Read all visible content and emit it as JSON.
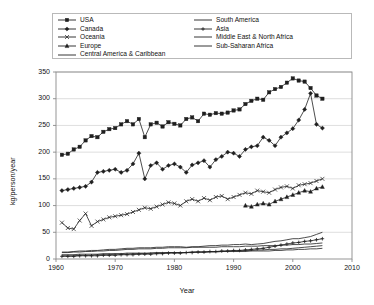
{
  "chart_data": {
    "type": "line",
    "title": "",
    "xlabel": "Year",
    "ylabel": "kg/person/year",
    "xlim": [
      1960,
      2010
    ],
    "ylim": [
      0,
      350
    ],
    "xticks": [
      1960,
      1970,
      1980,
      1990,
      2000,
      2010
    ],
    "yticks": [
      0,
      50,
      100,
      150,
      200,
      250,
      300,
      350
    ],
    "grid": "horizontal",
    "legend_position": "top",
    "legend_columns": 2,
    "x": [
      1961,
      1962,
      1963,
      1964,
      1965,
      1966,
      1967,
      1968,
      1969,
      1970,
      1971,
      1972,
      1973,
      1974,
      1975,
      1976,
      1977,
      1978,
      1979,
      1980,
      1981,
      1982,
      1983,
      1984,
      1985,
      1986,
      1987,
      1988,
      1989,
      1990,
      1991,
      1992,
      1993,
      1994,
      1995,
      1996,
      1997,
      1998,
      1999,
      2000,
      2001,
      2002,
      2003,
      2004,
      2005
    ],
    "series": [
      {
        "name": "USA",
        "marker": "square",
        "values": [
          195,
          197,
          205,
          210,
          222,
          230,
          228,
          238,
          243,
          245,
          252,
          258,
          252,
          262,
          228,
          252,
          255,
          248,
          256,
          253,
          250,
          262,
          265,
          258,
          272,
          270,
          273,
          272,
          274,
          278,
          280,
          290,
          296,
          300,
          298,
          312,
          318,
          322,
          330,
          338,
          334,
          332,
          320,
          306,
          300
        ]
      },
      {
        "name": "Canada",
        "marker": "diamond",
        "values": [
          128,
          130,
          132,
          134,
          136,
          144,
          162,
          164,
          166,
          168,
          162,
          166,
          178,
          198,
          150,
          175,
          180,
          168,
          175,
          178,
          172,
          162,
          176,
          180,
          184,
          172,
          186,
          192,
          200,
          198,
          192,
          205,
          210,
          212,
          228,
          222,
          212,
          228,
          236,
          244,
          260,
          280,
          310,
          252,
          245
        ]
      },
      {
        "name": "Oceania",
        "marker": "x",
        "values": [
          68,
          58,
          56,
          72,
          85,
          62,
          70,
          74,
          78,
          80,
          82,
          84,
          88,
          92,
          96,
          94,
          98,
          102,
          106,
          104,
          100,
          108,
          112,
          108,
          114,
          110,
          116,
          118,
          112,
          116,
          120,
          124,
          122,
          128,
          126,
          124,
          130,
          134,
          136,
          132,
          138,
          140,
          142,
          146,
          150
        ]
      },
      {
        "name": "Europe",
        "marker": "triangle",
        "values": [
          null,
          null,
          null,
          null,
          null,
          null,
          null,
          null,
          null,
          null,
          null,
          null,
          null,
          null,
          null,
          null,
          null,
          null,
          null,
          null,
          null,
          null,
          null,
          null,
          null,
          null,
          null,
          null,
          null,
          null,
          null,
          100,
          98,
          102,
          104,
          102,
          108,
          112,
          116,
          120,
          124,
          128,
          126,
          132,
          135
        ]
      },
      {
        "name": "Central America & Caribbean",
        "marker": "none",
        "values": [
          12,
          12,
          13,
          13,
          14,
          14,
          15,
          15,
          16,
          16,
          17,
          18,
          18,
          19,
          19,
          19,
          20,
          20,
          21,
          21,
          21,
          21,
          22,
          22,
          22,
          22,
          22,
          23,
          23,
          23,
          23,
          24,
          24,
          24,
          25,
          25,
          25,
          26,
          26,
          27,
          27,
          28,
          28,
          29,
          30
        ]
      },
      {
        "name": "South America",
        "marker": "none",
        "values": [
          13,
          13,
          14,
          15,
          15,
          16,
          16,
          17,
          18,
          18,
          19,
          20,
          20,
          21,
          21,
          21,
          22,
          22,
          23,
          23,
          23,
          22,
          23,
          23,
          24,
          25,
          25,
          26,
          26,
          27,
          27,
          28,
          27,
          28,
          29,
          31,
          33,
          34,
          36,
          38,
          38,
          40,
          42,
          46,
          50
        ]
      },
      {
        "name": "Asia",
        "marker": "plus",
        "values": [
          5,
          5,
          5,
          6,
          6,
          6,
          6,
          7,
          7,
          7,
          8,
          8,
          8,
          9,
          9,
          9,
          10,
          10,
          11,
          11,
          11,
          12,
          12,
          13,
          13,
          14,
          14,
          15,
          15,
          16,
          16,
          17,
          18,
          19,
          20,
          22,
          24,
          26,
          28,
          30,
          31,
          33,
          34,
          36,
          38
        ]
      },
      {
        "name": "Middle East & North Africa",
        "marker": "none",
        "values": [
          6,
          6,
          6,
          7,
          7,
          7,
          8,
          8,
          8,
          9,
          9,
          9,
          10,
          10,
          10,
          11,
          11,
          11,
          12,
          12,
          12,
          12,
          13,
          13,
          13,
          14,
          14,
          14,
          15,
          15,
          15,
          16,
          16,
          17,
          17,
          18,
          18,
          19,
          19,
          20,
          21,
          22,
          23,
          24,
          25
        ]
      },
      {
        "name": "Sub-Saharan Africa",
        "marker": "none",
        "values": [
          8,
          8,
          8,
          9,
          9,
          9,
          9,
          10,
          10,
          10,
          10,
          11,
          11,
          11,
          11,
          11,
          12,
          12,
          12,
          12,
          12,
          12,
          13,
          13,
          13,
          13,
          13,
          14,
          14,
          14,
          14,
          14,
          15,
          15,
          15,
          15,
          16,
          16,
          17,
          17,
          18,
          18,
          19,
          19,
          20
        ]
      }
    ]
  },
  "legend": {
    "left_column": [
      {
        "label": "USA",
        "marker": "square"
      },
      {
        "label": "Canada",
        "marker": "diamond"
      },
      {
        "label": "Oceania",
        "marker": "x"
      },
      {
        "label": "Europe",
        "marker": "triangle"
      },
      {
        "label": "Central America & Caribbean",
        "marker": "none"
      }
    ],
    "right_column": [
      {
        "label": "South America",
        "marker": "none"
      },
      {
        "label": "Asia",
        "marker": "plus"
      },
      {
        "label": "Middle East & North Africa",
        "marker": "none"
      },
      {
        "label": "Sub-Saharan Africa",
        "marker": "none"
      }
    ]
  },
  "axes": {
    "y_title": "kg/person/year",
    "x_title": "Year",
    "y_ticks": [
      "0",
      "50",
      "100",
      "150",
      "200",
      "250",
      "300",
      "350"
    ],
    "x_ticks": [
      "1960",
      "1970",
      "1980",
      "1990",
      "2000",
      "2010"
    ]
  },
  "colors": {
    "line": "#1f1f1f",
    "grid": "#c8c8c8",
    "axis": "#8a8a8a",
    "background": "#ffffff"
  }
}
